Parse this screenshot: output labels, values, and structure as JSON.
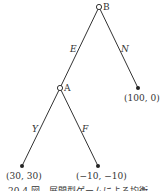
{
  "tree": {
    "nodes": [
      {
        "id": "B",
        "label": "B",
        "type": "decision"
      },
      {
        "id": "A",
        "label": "A",
        "type": "decision"
      }
    ],
    "edges": [
      {
        "from": "B",
        "to": "A",
        "label": "E"
      },
      {
        "from": "B",
        "to": "leaf1",
        "label": "N"
      },
      {
        "from": "A",
        "to": "leaf2",
        "label": "Y"
      },
      {
        "from": "A",
        "to": "leaf3",
        "label": "F"
      }
    ],
    "leaves": [
      {
        "id": "leaf1",
        "payoff": "(100, 0)"
      },
      {
        "id": "leaf2",
        "payoff": "(30, 30)"
      },
      {
        "id": "leaf3",
        "payoff": "(−10, −10)"
      }
    ]
  },
  "caption": "20-4 図　展開型ゲームによる均衡"
}
